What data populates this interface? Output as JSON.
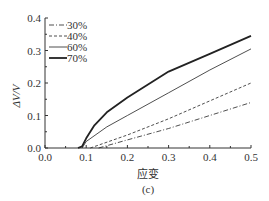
{
  "chart_data": {
    "type": "line",
    "title": "",
    "caption": "(c)",
    "xlabel": "应变",
    "ylabel": "ΔV/V",
    "xlim": [
      0.0,
      0.5
    ],
    "ylim": [
      0.0,
      0.4
    ],
    "xticks": [
      "0.0",
      "0.1",
      "0.2",
      "0.3",
      "0.4",
      "0.5"
    ],
    "yticks": [
      "0.0",
      "0.1",
      "0.2",
      "0.3",
      "0.4"
    ],
    "grid": false,
    "legend_position": "upper left",
    "series": [
      {
        "name": "30%",
        "style": "dash-dot",
        "x": [
          0.13,
          0.2,
          0.3,
          0.4,
          0.5
        ],
        "y": [
          0.0,
          0.025,
          0.06,
          0.1,
          0.14
        ]
      },
      {
        "name": "40%",
        "style": "dashed",
        "x": [
          0.11,
          0.2,
          0.3,
          0.4,
          0.5
        ],
        "y": [
          0.0,
          0.04,
          0.09,
          0.145,
          0.2
        ]
      },
      {
        "name": "60%",
        "style": "thin solid",
        "x": [
          0.09,
          0.1,
          0.15,
          0.2,
          0.3,
          0.4,
          0.5
        ],
        "y": [
          0.0,
          0.02,
          0.065,
          0.1,
          0.17,
          0.24,
          0.305
        ]
      },
      {
        "name": "70%",
        "style": "thick solid",
        "x": [
          0.08,
          0.09,
          0.1,
          0.12,
          0.15,
          0.2,
          0.3,
          0.4,
          0.5
        ],
        "y": [
          0.0,
          0.005,
          0.03,
          0.07,
          0.11,
          0.155,
          0.235,
          0.29,
          0.345
        ]
      }
    ]
  },
  "legend": [
    "30%",
    "40%",
    "60%",
    "70%"
  ]
}
